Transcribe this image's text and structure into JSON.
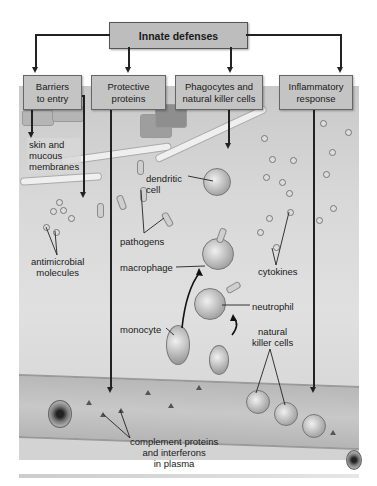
{
  "diagram": {
    "title": "Innate defenses",
    "categories": [
      {
        "id": "barriers",
        "label": "Barriers to entry",
        "line1": "Barriers",
        "line2": "to entry"
      },
      {
        "id": "proteins",
        "label": "Protective proteins",
        "line1": "Protective",
        "line2": "proteins"
      },
      {
        "id": "phagocytes",
        "label": "Phagocytes and natural killer cells",
        "line1": "Phagocytes and",
        "line2": "natural killer cells"
      },
      {
        "id": "inflammatory",
        "label": "Inflammatory response",
        "line1": "Inflammatory",
        "line2": "response"
      }
    ],
    "labels": {
      "skin": {
        "line1": "skin and",
        "line2": "mucous",
        "line3": "membranes"
      },
      "antimicrobial": {
        "line1": "antimicrobial",
        "line2": "molecules"
      },
      "dendritic": {
        "line1": "dendritic",
        "line2": "cell"
      },
      "pathogens": "pathogens",
      "macrophage": "macrophage",
      "cytokines": "cytokines",
      "neutrophil": "neutrophil",
      "monocyte": "monocyte",
      "nk": {
        "line1": "natural",
        "line2": "killer cells"
      },
      "complement": {
        "line1": "complement proteins",
        "line2": "and interferons",
        "line3": "in plasma"
      }
    },
    "edges": [
      {
        "from": "Innate defenses",
        "to": "Barriers to entry"
      },
      {
        "from": "Innate defenses",
        "to": "Protective proteins"
      },
      {
        "from": "Innate defenses",
        "to": "Phagocytes and natural killer cells"
      },
      {
        "from": "Innate defenses",
        "to": "Inflammatory response"
      },
      {
        "from": "Barriers to entry",
        "to": "skin and mucous membranes"
      },
      {
        "from": "Barriers to entry",
        "to": "antimicrobial molecules"
      },
      {
        "from": "Protective proteins",
        "to": "complement proteins and interferons in plasma"
      },
      {
        "from": "Phagocytes and natural killer cells",
        "to": "dendritic cell"
      },
      {
        "from": "monocyte",
        "to": "macrophage"
      },
      {
        "from": "Inflammatory response",
        "to": "blood vessel"
      }
    ],
    "colors": {
      "box_fill": "#c4c4c4",
      "title_box_fill": "#bdbdbd",
      "line": "#222222",
      "background": "#d8d8d8"
    }
  }
}
